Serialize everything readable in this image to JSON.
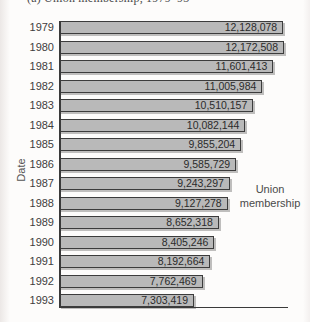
{
  "title": "(a) Union membership, 1979–93",
  "y_axis_label": "Date",
  "annotation": {
    "line1": "Union",
    "line2": "membership"
  },
  "colors": {
    "bar_fill": "#b9b9b9",
    "bar_border": "#3c3c3c",
    "axis": "#3a3a3a",
    "label_text": "#3d3d3d",
    "value_text": "#2b2b2b",
    "background": "#fdfcfb"
  },
  "chart_data": {
    "type": "bar",
    "orientation": "horizontal",
    "title": "(a) Union membership, 1979–93",
    "xlabel": "Union membership",
    "ylabel": "Date",
    "categories": [
      "1979",
      "1980",
      "1981",
      "1982",
      "1983",
      "1984",
      "1985",
      "1986",
      "1987",
      "1988",
      "1989",
      "1990",
      "1991",
      "1992",
      "1993"
    ],
    "values": [
      12128078,
      12172508,
      11601413,
      11005984,
      10510157,
      10082144,
      9855204,
      9585729,
      9243297,
      9127278,
      8652318,
      8405246,
      8192664,
      7762469,
      7303419
    ],
    "value_labels": [
      "12,128,078",
      "12,172,508",
      "11,601,413",
      "11,005,984",
      "10,510,157",
      "10,082,144",
      "9,855,204",
      "9,585,729",
      "9,243,297",
      "9,127,278",
      "8,652,318",
      "8,405,246",
      "8,192,664",
      "7,762,469",
      "7,303,419"
    ],
    "xlim": [
      0,
      12172508
    ],
    "grid": false,
    "legend": "none",
    "value_labels_position": "inside-end"
  }
}
